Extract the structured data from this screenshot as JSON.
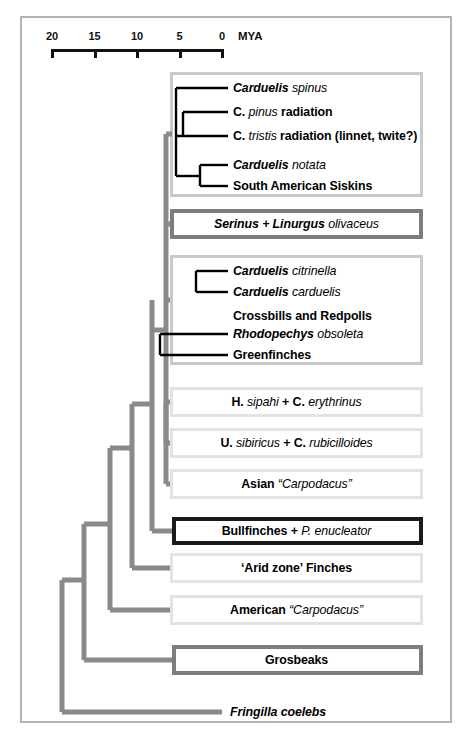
{
  "figure": {
    "type": "phylogenetic-tree",
    "axis": {
      "unit_label": "MYA",
      "ticks": [
        {
          "label": "20",
          "value": 20
        },
        {
          "label": "15",
          "value": 15
        },
        {
          "label": "10",
          "value": 10
        },
        {
          "label": "5",
          "value": 5
        },
        {
          "label": "0",
          "value": 0
        }
      ]
    },
    "colors": {
      "frame": "#b4b4b4",
      "branch_gray": "#8a8a8a",
      "branch_black": "#000000",
      "box_big": "#c9c9c9",
      "box_light": "#e2e2e2",
      "box_mid": "#7d7d7d",
      "box_dark": "#1a1a1a"
    },
    "taxa": [
      {
        "id": "carduelis-spinus",
        "parts": [
          {
            "t": "Carduelis",
            "s": "bi"
          },
          {
            "t": " spinus",
            "s": "i"
          }
        ]
      },
      {
        "id": "c-pinus-radiation",
        "parts": [
          {
            "t": "C.",
            "s": "b"
          },
          {
            "t": " pinus",
            "s": "i"
          },
          {
            "t": " radiation",
            "s": "b"
          }
        ]
      },
      {
        "id": "c-tristis-radiation",
        "parts": [
          {
            "t": "C.",
            "s": "b"
          },
          {
            "t": " tristis",
            "s": "i"
          },
          {
            "t": " radiation (linnet, twite?)",
            "s": "b"
          }
        ]
      },
      {
        "id": "carduelis-notata",
        "parts": [
          {
            "t": "Carduelis",
            "s": "bi"
          },
          {
            "t": " notata",
            "s": "i"
          }
        ]
      },
      {
        "id": "south-american-siskins",
        "parts": [
          {
            "t": "South American Siskins",
            "s": "b"
          }
        ]
      },
      {
        "id": "serinus-linurgus",
        "parts": [
          {
            "t": "Serinus + Linurgus",
            "s": "bi"
          },
          {
            "t": " olivaceus",
            "s": "i"
          }
        ]
      },
      {
        "id": "carduelis-citrinella",
        "parts": [
          {
            "t": "Carduelis",
            "s": "bi"
          },
          {
            "t": " citrinella",
            "s": "i"
          }
        ]
      },
      {
        "id": "carduelis-carduelis",
        "parts": [
          {
            "t": "Carduelis",
            "s": "bi"
          },
          {
            "t": " carduelis",
            "s": "i"
          }
        ]
      },
      {
        "id": "crossbills-redpolls",
        "parts": [
          {
            "t": "Crossbills and Redpolls",
            "s": "b"
          }
        ]
      },
      {
        "id": "rhodopechys-obsoleta",
        "parts": [
          {
            "t": "Rhodopechys",
            "s": "bi"
          },
          {
            "t": " obsoleta",
            "s": "i"
          }
        ]
      },
      {
        "id": "greenfinches",
        "parts": [
          {
            "t": "Greenfinches",
            "s": "b"
          }
        ]
      },
      {
        "id": "h-sipahi-c-erythrinus",
        "parts": [
          {
            "t": "H.",
            "s": "b"
          },
          {
            "t": " sipahi",
            "s": "i"
          },
          {
            "t": " + ",
            "s": "b"
          },
          {
            "t": "C.",
            "s": "b"
          },
          {
            "t": " erythrinus",
            "s": "i"
          }
        ]
      },
      {
        "id": "u-sibiricus-c-rubicilloides",
        "parts": [
          {
            "t": "U.",
            "s": "b"
          },
          {
            "t": " sibiricus",
            "s": "i"
          },
          {
            "t": " + ",
            "s": "b"
          },
          {
            "t": "C.",
            "s": "b"
          },
          {
            "t": " rubicilloides",
            "s": "i"
          }
        ]
      },
      {
        "id": "asian-carpodacus",
        "parts": [
          {
            "t": "Asian ",
            "s": "b"
          },
          {
            "t": "“Carpodacus”",
            "s": "i"
          }
        ]
      },
      {
        "id": "bullfinches-p-enucleator",
        "parts": [
          {
            "t": "Bullfinches + ",
            "s": "b"
          },
          {
            "t": "P. enucleator",
            "s": "i"
          }
        ]
      },
      {
        "id": "arid-zone-finches",
        "parts": [
          {
            "t": "‘Arid zone’ Finches",
            "s": "b"
          }
        ]
      },
      {
        "id": "american-carpodacus",
        "parts": [
          {
            "t": "American ",
            "s": "b"
          },
          {
            "t": "“Carpodacus”",
            "s": "i"
          }
        ]
      },
      {
        "id": "grosbeaks",
        "parts": [
          {
            "t": "Grosbeaks",
            "s": "b"
          }
        ]
      },
      {
        "id": "fringilla-coelebs",
        "parts": [
          {
            "t": "Fringilla coelebs",
            "s": "bi"
          }
        ]
      }
    ]
  }
}
